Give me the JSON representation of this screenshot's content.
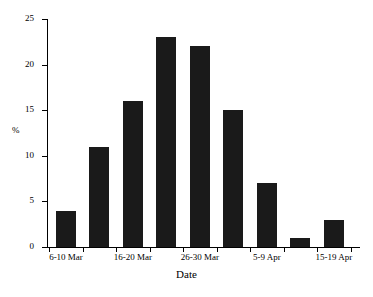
{
  "chart_data": {
    "type": "bar",
    "title": "",
    "xlabel": "Date",
    "ylabel": "%",
    "categories": [
      "6-10 Mar",
      "11-15 Mar",
      "16-20 Mar",
      "21-25 Mar",
      "26-30 Mar",
      "31 Mar-4 Apr",
      "5-9 Apr",
      "10-14 Apr",
      "15-19 Apr"
    ],
    "values": [
      4,
      11,
      16,
      23,
      22,
      15,
      7,
      1,
      3
    ],
    "visible_tick_labels": [
      "6-10 Mar",
      "16-20 Mar",
      "26-30 Mar",
      "5-9 Apr",
      "15-19 Apr"
    ],
    "visible_tick_label_indices": [
      0,
      2,
      4,
      6,
      8
    ],
    "ytick_labels": [
      "0",
      "5",
      "10",
      "15",
      "20",
      "25"
    ],
    "ytick_values": [
      0,
      5,
      10,
      15,
      20,
      25
    ],
    "ylim": [
      0,
      25
    ],
    "grid": false,
    "legend": false,
    "bar_color": "#1a1a1a",
    "axis_color": "#000000",
    "background_color": "#ffffff"
  }
}
